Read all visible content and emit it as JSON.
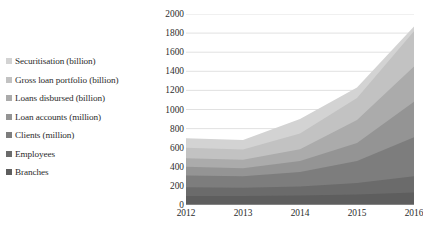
{
  "figure": {
    "cropped_title_fragment": "..."
  },
  "legend": {
    "position": "left",
    "items": [
      {
        "label": "Securitisation (billion)",
        "color": "#d3d3d3"
      },
      {
        "label": "Gross loan portfolio (billion)",
        "color": "#c2c2c2"
      },
      {
        "label": "Loans disbursed (billion)",
        "color": "#ababab"
      },
      {
        "label": "Loan accounts (million)",
        "color": "#949494"
      },
      {
        "label": "Clients (million)",
        "color": "#7d7d7d"
      },
      {
        "label": "Employees",
        "color": "#6b6b6b"
      },
      {
        "label": "Branches",
        "color": "#5e5e5e"
      }
    ]
  },
  "chart_data": {
    "type": "area",
    "stacked": true,
    "title": "",
    "xlabel": "",
    "ylabel": "",
    "x": [
      "2012",
      "2013",
      "2014",
      "2015",
      "2016"
    ],
    "categories": [
      "2012",
      "2013",
      "2014",
      "2015",
      "2016"
    ],
    "xtick_labels": [
      "2012",
      "2013",
      "2014",
      "2015",
      "2016"
    ],
    "ytick_labels": [
      "0",
      "200",
      "400",
      "600",
      "800",
      "1000",
      "1200",
      "1400",
      "1600",
      "1800",
      "2000"
    ],
    "ytick_values": [
      0,
      200,
      400,
      600,
      800,
      1000,
      1200,
      1400,
      1600,
      1800,
      2000
    ],
    "ylim": [
      0,
      2000
    ],
    "ytick_step": 200,
    "grid": true,
    "grid_axis": "y",
    "legend_position": "left",
    "stack_order_bottom_to_top": [
      "Branches",
      "Employees",
      "Clients (million)",
      "Loan accounts (million)",
      "Loans disbursed (billion)",
      "Gross loan portfolio (billion)",
      "Securitisation (billion)"
    ],
    "series": [
      {
        "name": "Branches",
        "color": "#5e5e5e",
        "values": [
          95,
          95,
          100,
          110,
          130
        ]
      },
      {
        "name": "Employees",
        "color": "#6b6b6b",
        "values": [
          90,
          85,
          95,
          120,
          170
        ]
      },
      {
        "name": "Clients (million)",
        "color": "#7d7d7d",
        "values": [
          125,
          120,
          150,
          230,
          410
        ]
      },
      {
        "name": "Loan accounts (million)",
        "color": "#949494",
        "values": [
          90,
          85,
          115,
          190,
          370
        ]
      },
      {
        "name": "Loans disbursed (billion)",
        "color": "#ababab",
        "values": [
          90,
          90,
          125,
          240,
          370
        ]
      },
      {
        "name": "Gross loan portfolio (billion)",
        "color": "#c2c2c2",
        "values": [
          110,
          105,
          165,
          230,
          370
        ]
      },
      {
        "name": "Securitisation (billion)",
        "color": "#d3d3d3",
        "values": [
          100,
          100,
          150,
          110,
          50
        ]
      }
    ],
    "stack_totals": [
      700,
      680,
      900,
      1230,
      1870
    ],
    "cumulative_tops": [
      {
        "x": "2012",
        "tops": [
          95,
          185,
          310,
          400,
          490,
          600,
          700
        ]
      },
      {
        "x": "2013",
        "tops": [
          95,
          180,
          300,
          385,
          475,
          580,
          680
        ]
      },
      {
        "x": "2014",
        "tops": [
          100,
          195,
          345,
          460,
          585,
          750,
          900
        ]
      },
      {
        "x": "2015",
        "tops": [
          110,
          230,
          460,
          650,
          890,
          1120,
          1230
        ]
      },
      {
        "x": "2016",
        "tops": [
          130,
          300,
          710,
          1080,
          1450,
          1820,
          1870
        ]
      }
    ]
  },
  "style": {
    "plot_background": "#ffffff",
    "gridline_color": "#d9d9d9",
    "text_color": "#2b2b2b"
  }
}
